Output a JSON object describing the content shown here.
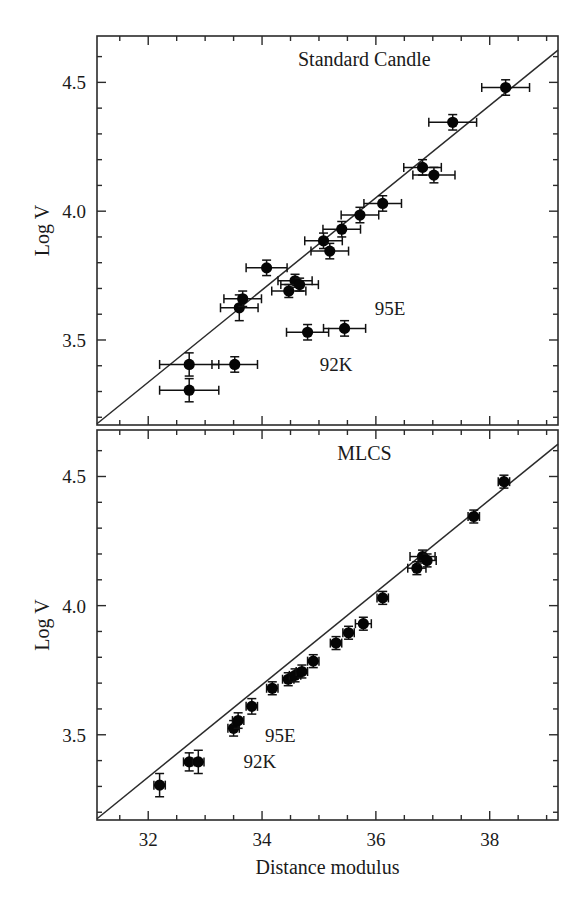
{
  "figure": {
    "xlabel": "Distance modulus",
    "ylabel_top": "Log V",
    "ylabel_bottom": "Log V"
  },
  "chart_data": [
    {
      "type": "scatter",
      "title": "Standard Candle",
      "xlabel": "Distance modulus",
      "ylabel": "Log V",
      "xlim": [
        31.1,
        39.2
      ],
      "ylim": [
        3.17,
        4.68
      ],
      "xticks": [
        32,
        34,
        36,
        38
      ],
      "xticklabels": [
        "32",
        "34",
        "36",
        "38"
      ],
      "xminor_step": 0.5,
      "yticks": [
        3.5,
        4.0,
        4.5
      ],
      "yticklabels": [
        "3.5",
        "4.0",
        "4.5"
      ],
      "yminor_step": 0.1,
      "grid": false,
      "legend": "none",
      "fit_line": {
        "x": [
          31.1,
          39.2
        ],
        "y": [
          3.175,
          4.625
        ]
      },
      "points": [
        {
          "x": 32.72,
          "y": 3.305,
          "xerr": 0.52,
          "yerr": 0.045
        },
        {
          "x": 32.72,
          "y": 3.405,
          "xerr": 0.52,
          "yerr": 0.045
        },
        {
          "x": 33.52,
          "y": 3.405,
          "xerr": 0.4,
          "yerr": 0.03
        },
        {
          "x": 33.6,
          "y": 3.625,
          "xerr": 0.33,
          "yerr": 0.05
        },
        {
          "x": 33.66,
          "y": 3.66,
          "xerr": 0.33,
          "yerr": 0.03
        },
        {
          "x": 34.08,
          "y": 3.78,
          "xerr": 0.36,
          "yerr": 0.03
        },
        {
          "x": 34.47,
          "y": 3.69,
          "xerr": 0.3,
          "yerr": 0.025
        },
        {
          "x": 34.58,
          "y": 3.73,
          "xerr": 0.3,
          "yerr": 0.025
        },
        {
          "x": 34.66,
          "y": 3.715,
          "xerr": 0.33,
          "yerr": 0.025
        },
        {
          "x": 34.8,
          "y": 3.53,
          "xerr": 0.37,
          "yerr": 0.03
        },
        {
          "x": 35.08,
          "y": 3.885,
          "xerr": 0.33,
          "yerr": 0.03
        },
        {
          "x": 35.19,
          "y": 3.845,
          "xerr": 0.33,
          "yerr": 0.03
        },
        {
          "x": 35.45,
          "y": 3.545,
          "xerr": 0.37,
          "yerr": 0.03
        },
        {
          "x": 35.4,
          "y": 3.93,
          "xerr": 0.33,
          "yerr": 0.03
        },
        {
          "x": 35.72,
          "y": 3.985,
          "xerr": 0.33,
          "yerr": 0.03
        },
        {
          "x": 36.12,
          "y": 4.03,
          "xerr": 0.33,
          "yerr": 0.03
        },
        {
          "x": 36.82,
          "y": 4.17,
          "xerr": 0.33,
          "yerr": 0.03
        },
        {
          "x": 37.02,
          "y": 4.14,
          "xerr": 0.37,
          "yerr": 0.03
        },
        {
          "x": 37.35,
          "y": 4.345,
          "xerr": 0.42,
          "yerr": 0.03
        },
        {
          "x": 38.28,
          "y": 4.48,
          "xerr": 0.42,
          "yerr": 0.03
        }
      ],
      "annotations": [
        {
          "text": "92K",
          "x": 35.3,
          "y": 3.405
        },
        {
          "text": "95E",
          "x": 36.25,
          "y": 3.625
        }
      ]
    },
    {
      "type": "scatter",
      "title": "MLCS",
      "xlabel": "Distance modulus",
      "ylabel": "Log V",
      "xlim": [
        31.1,
        39.2
      ],
      "ylim": [
        3.17,
        4.68
      ],
      "xticks": [
        32,
        34,
        36,
        38
      ],
      "xticklabels": [
        "32",
        "34",
        "36",
        "38"
      ],
      "xminor_step": 0.5,
      "yticks": [
        3.5,
        4.0,
        4.5
      ],
      "yticklabels": [
        "3.5",
        "4.0",
        "4.5"
      ],
      "yminor_step": 0.1,
      "grid": false,
      "legend": "none",
      "fit_line": {
        "x": [
          31.1,
          39.2
        ],
        "y": [
          3.175,
          4.625
        ]
      },
      "points": [
        {
          "x": 32.2,
          "y": 3.305,
          "xerr": 0.1,
          "yerr": 0.045
        },
        {
          "x": 32.72,
          "y": 3.395,
          "xerr": 0.1,
          "yerr": 0.035
        },
        {
          "x": 32.88,
          "y": 3.395,
          "xerr": 0.1,
          "yerr": 0.045
        },
        {
          "x": 33.5,
          "y": 3.525,
          "xerr": 0.1,
          "yerr": 0.03
        },
        {
          "x": 33.58,
          "y": 3.555,
          "xerr": 0.1,
          "yerr": 0.03
        },
        {
          "x": 33.82,
          "y": 3.61,
          "xerr": 0.1,
          "yerr": 0.03
        },
        {
          "x": 34.18,
          "y": 3.68,
          "xerr": 0.1,
          "yerr": 0.025
        },
        {
          "x": 34.46,
          "y": 3.715,
          "xerr": 0.1,
          "yerr": 0.025
        },
        {
          "x": 34.58,
          "y": 3.73,
          "xerr": 0.1,
          "yerr": 0.025
        },
        {
          "x": 34.7,
          "y": 3.745,
          "xerr": 0.1,
          "yerr": 0.025
        },
        {
          "x": 34.9,
          "y": 3.785,
          "xerr": 0.1,
          "yerr": 0.025
        },
        {
          "x": 35.3,
          "y": 3.855,
          "xerr": 0.1,
          "yerr": 0.025
        },
        {
          "x": 35.52,
          "y": 3.895,
          "xerr": 0.1,
          "yerr": 0.025
        },
        {
          "x": 35.78,
          "y": 3.93,
          "xerr": 0.14,
          "yerr": 0.025
        },
        {
          "x": 36.12,
          "y": 4.03,
          "xerr": 0.1,
          "yerr": 0.025
        },
        {
          "x": 36.72,
          "y": 4.145,
          "xerr": 0.16,
          "yerr": 0.025
        },
        {
          "x": 36.82,
          "y": 4.19,
          "xerr": 0.22,
          "yerr": 0.025
        },
        {
          "x": 36.9,
          "y": 4.175,
          "xerr": 0.16,
          "yerr": 0.025
        },
        {
          "x": 37.72,
          "y": 4.345,
          "xerr": 0.1,
          "yerr": 0.025
        },
        {
          "x": 38.25,
          "y": 4.48,
          "xerr": 0.1,
          "yerr": 0.025
        }
      ],
      "annotations": [
        {
          "text": "95E",
          "x": 34.32,
          "y": 3.5
        },
        {
          "text": "92K",
          "x": 33.96,
          "y": 3.398
        }
      ]
    }
  ]
}
